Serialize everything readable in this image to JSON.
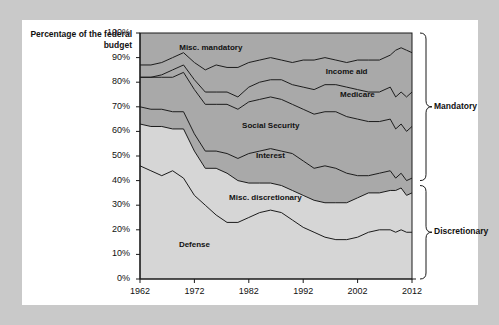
{
  "chart_data": {
    "type": "area",
    "title": "",
    "subtitle": "",
    "xlabel": "",
    "ylabel": "Percentage of the federal budget",
    "xlim": [
      1962,
      2012
    ],
    "ylim": [
      0,
      100
    ],
    "grid": false,
    "stacked": true,
    "stack_order_bottom_to_top": [
      "Defense",
      "Misc. discretionary",
      "Interest",
      "Social Security",
      "Medicare",
      "Income aid",
      "Misc. mandatory"
    ],
    "legend_position": "inline-labels",
    "y_tick_labels": [
      "100%",
      "90%",
      "80%",
      "70%",
      "60%",
      "50%",
      "40%",
      "30%",
      "20%",
      "10%",
      "0%"
    ],
    "y_tick_values": [
      100,
      90,
      80,
      70,
      60,
      50,
      40,
      30,
      20,
      10,
      0
    ],
    "x_tick_labels": [
      "1962",
      "1972",
      "1982",
      "1992",
      "2002",
      "2012"
    ],
    "x_tick_values": [
      1962,
      1972,
      1982,
      1992,
      2002,
      2012
    ],
    "x": [
      1962,
      1964,
      1966,
      1968,
      1970,
      1972,
      1974,
      1976,
      1978,
      1980,
      1982,
      1984,
      1986,
      1988,
      1990,
      1992,
      1994,
      1996,
      1998,
      2000,
      2002,
      2004,
      2006,
      2008,
      2009,
      2010,
      2011,
      2012
    ],
    "series": [
      {
        "name": "Defense",
        "label": "Defense",
        "color": "#d6d6d6",
        "values": [
          46,
          44,
          42,
          44,
          41,
          34,
          30,
          26,
          23,
          23,
          25,
          27,
          28,
          27,
          24,
          21,
          19,
          17,
          16,
          16,
          17,
          19,
          20,
          20,
          19,
          20,
          19,
          19
        ]
      },
      {
        "name": "Misc. discretionary",
        "label": "Misc. discretionary",
        "color": "#d6d6d6",
        "values": [
          17,
          18,
          20,
          17,
          20,
          18,
          15,
          19,
          20,
          17,
          14,
          12,
          11,
          11,
          12,
          13,
          13,
          14,
          15,
          15,
          16,
          16,
          15,
          16,
          17,
          17,
          15,
          16
        ]
      },
      {
        "name": "Interest",
        "label": "Interest",
        "color": "#a9a9a9",
        "values": [
          7,
          7,
          7,
          7,
          7,
          7,
          7,
          7,
          8,
          9,
          12,
          13,
          14,
          14,
          15,
          14,
          13,
          15,
          14,
          12,
          9,
          7,
          8,
          8,
          5,
          6,
          6,
          6
        ]
      },
      {
        "name": "Social Security",
        "label": "Social Security",
        "color": "#a9a9a9",
        "values": [
          12,
          13,
          13,
          14,
          16,
          18,
          19,
          19,
          20,
          20,
          21,
          21,
          21,
          21,
          20,
          21,
          22,
          22,
          23,
          23,
          23,
          22,
          21,
          21,
          20,
          20,
          20,
          21
        ]
      },
      {
        "name": "Medicare",
        "label": "Medicare",
        "color": "#a9a9a9",
        "values": [
          0,
          0,
          1,
          3,
          3,
          4,
          5,
          5,
          5,
          5,
          6,
          7,
          7,
          8,
          8,
          9,
          10,
          11,
          11,
          12,
          12,
          12,
          12,
          13,
          13,
          13,
          14,
          14
        ]
      },
      {
        "name": "Income aid",
        "label": "Income aid",
        "color": "#a9a9a9",
        "values": [
          5,
          5,
          5,
          5,
          5,
          7,
          9,
          11,
          10,
          12,
          10,
          9,
          9,
          8,
          9,
          11,
          12,
          11,
          10,
          10,
          12,
          13,
          13,
          13,
          19,
          18,
          19,
          16
        ]
      },
      {
        "name": "Misc. mandatory",
        "label": "Misc. mandatory",
        "color": "#a9a9a9",
        "values": [
          13,
          13,
          12,
          10,
          8,
          12,
          15,
          13,
          14,
          14,
          12,
          11,
          10,
          11,
          12,
          11,
          11,
          10,
          11,
          12,
          11,
          11,
          11,
          9,
          7,
          6,
          7,
          8
        ]
      }
    ],
    "annotations": [
      {
        "text": "Misc. mandatory",
        "x": 1975,
        "y": 94
      },
      {
        "text": "Income aid",
        "x": 2000,
        "y": 84
      },
      {
        "text": "Medicare",
        "x": 2002,
        "y": 75
      },
      {
        "text": "Social Security",
        "x": 1986,
        "y": 62
      },
      {
        "text": "Interest",
        "x": 1986,
        "y": 50
      },
      {
        "text": "Misc. discretionary",
        "x": 1985,
        "y": 33
      },
      {
        "text": "Defense",
        "x": 1972,
        "y": 14
      }
    ],
    "brackets": [
      {
        "label": "Mandatory",
        "from": 40,
        "to": 100
      },
      {
        "label": "Discretionary",
        "from": 0,
        "to": 38
      }
    ]
  }
}
